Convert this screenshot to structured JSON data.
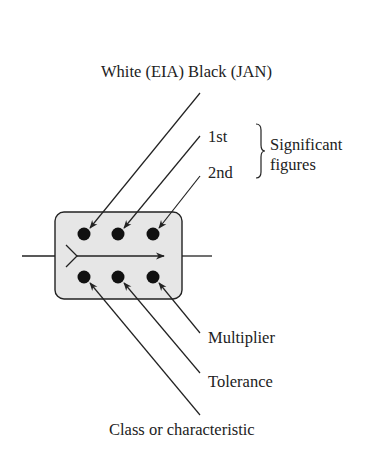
{
  "diagram": {
    "type": "capacitor-color-code-mica",
    "labels": {
      "top": "White (EIA) Black (JAN)",
      "first": "1st",
      "second": "2nd",
      "significant_line1": "Significant",
      "significant_line2": "figures",
      "multiplier": "Multiplier",
      "tolerance": "Tolerance",
      "class": "Class or characteristic"
    },
    "colors": {
      "body_fill": "#e6e6e6",
      "stroke": "#222222",
      "dot": "#111111",
      "text": "#222222"
    },
    "dots": {
      "top_row": 3,
      "bottom_row": 3
    }
  }
}
